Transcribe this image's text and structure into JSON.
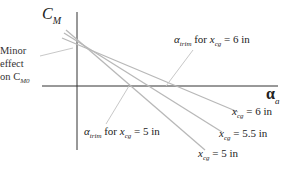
{
  "diagram": {
    "type": "pitching-moment-vs-angle-of-attack",
    "y_axis": {
      "symbol": "C",
      "subscript": "M"
    },
    "x_axis": {
      "symbol": "α",
      "subscript": "a"
    },
    "annotation_minor": {
      "line1": "Minor",
      "line2": "effect",
      "line3_prefix": "on C",
      "line3_sub": "M0"
    },
    "trim_labels": [
      {
        "alpha": "α",
        "sub": "trim",
        "text": " for ",
        "x": "x",
        "xsub": "cg",
        "eq": " = ",
        "value": "6 in"
      },
      {
        "alpha": "α",
        "sub": "trim",
        "text": " for ",
        "x": "x",
        "xsub": "cg",
        "eq": " = ",
        "value": "5 in"
      }
    ],
    "line_labels": [
      {
        "x": "x",
        "xsub": "cg",
        "eq": " = ",
        "value": "6 in"
      },
      {
        "x": "x",
        "xsub": "cg",
        "eq": " = ",
        "value": "5.5 in"
      },
      {
        "x": "x",
        "xsub": "cg",
        "eq": " = ",
        "value": "5 in"
      }
    ],
    "colors": {
      "axis": "#333333",
      "lines": "#b8b8b8",
      "leader": "#c8c8c8"
    }
  }
}
